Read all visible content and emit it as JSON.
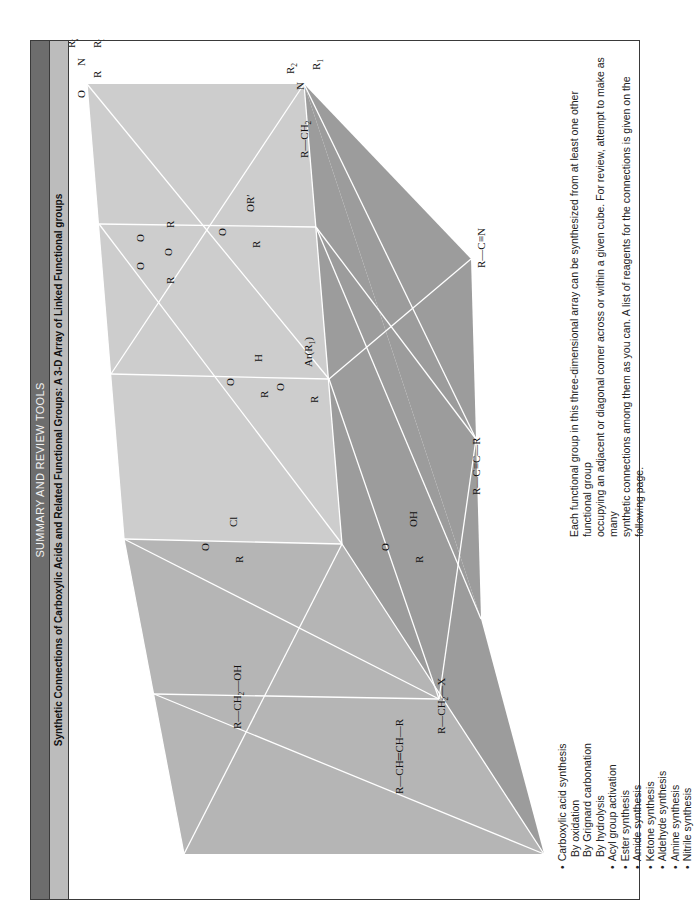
{
  "header": {
    "section_title": "SUMMARY AND REVIEW TOOLS",
    "figure_title": "Synthetic Connections of Carboxylic Acids and Related Functional Groups:  A 3-D Array of Linked Functional groups"
  },
  "diagram": {
    "type": "3-D cube array of functional groups",
    "nodes": {
      "amide": {
        "label": "R–C(=O)–N(R1)(R2)",
        "parts": [
          "O",
          "R",
          "N",
          "R₁",
          "R₂"
        ]
      },
      "amine": {
        "label": "R–CH2–N(R1)(R2)",
        "parts": [
          "R",
          "CH₂",
          "N",
          "R₁",
          "R₂"
        ]
      },
      "anhydride": {
        "label": "R–C(=O)–O–C(=O)–R",
        "parts": [
          "O",
          "O",
          "O",
          "R",
          "R"
        ]
      },
      "ester": {
        "label": "R–C(=O)–OR'",
        "parts": [
          "O",
          "R",
          "OR′"
        ]
      },
      "ketone": {
        "label": "R–C(=O)–Ar(R1)",
        "parts": [
          "O",
          "R",
          "Ar(R₁)"
        ]
      },
      "nitrile": {
        "label": "R–C≡N",
        "parts": [
          "R",
          "C",
          "N"
        ]
      },
      "aldehyde": {
        "label": "R–C(=O)–H",
        "parts": [
          "O",
          "R",
          "H"
        ]
      },
      "alkyne": {
        "label": "R–C≡C–R",
        "parts": [
          "R",
          "C",
          "C",
          "R"
        ]
      },
      "acid_chloride": {
        "label": "R–C(=O)–Cl",
        "parts": [
          "O",
          "R",
          "Cl"
        ]
      },
      "carboxylic_acid": {
        "label": "R–C(=O)–OH",
        "parts": [
          "O",
          "R",
          "OH"
        ]
      },
      "alcohol": {
        "label": "R–CH2–OH",
        "parts": [
          "R",
          "CH₂",
          "OH"
        ]
      },
      "alkyl_halide": {
        "label": "R–CH2–X",
        "parts": [
          "R",
          "CH₂",
          "X"
        ]
      },
      "alkene": {
        "label": "R–CH=CH–R",
        "parts": [
          "R",
          "CH",
          "CH",
          "R"
        ]
      }
    },
    "colors": {
      "face_top": "#c9c9c9",
      "face_left": "#b3b3b3",
      "face_right": "#9a9a9a",
      "edge": "#ffffff"
    }
  },
  "legend": {
    "items": [
      {
        "label": "Carboxylic acid synthesis",
        "level": 0
      },
      {
        "label": "By oxidation",
        "level": 1
      },
      {
        "label": "By Grignard carbonation",
        "level": 1
      },
      {
        "label": "By hydrolysis",
        "level": 1
      },
      {
        "label": "Acyl group activation",
        "level": 0
      },
      {
        "label": "Ester synthesis",
        "level": 0
      },
      {
        "label": "Amide synthesis",
        "level": 0
      },
      {
        "label": "Ketone synthesis",
        "level": 0
      },
      {
        "label": "Aldehyde synthesis",
        "level": 0
      },
      {
        "label": "Amine synthesis",
        "level": 0
      },
      {
        "label": "Nitrile synthesis",
        "level": 0
      }
    ]
  },
  "caption": {
    "line1": "Each functional group in this three-dimensional array can be synthesized from at least one other functional group",
    "line2": "occupying an adjacent or diagonal corner across or within a given cube. For review, attempt to make as many",
    "line3": "synthetic connections among them as you can. A list of reagents for the connections is given on the following page."
  }
}
